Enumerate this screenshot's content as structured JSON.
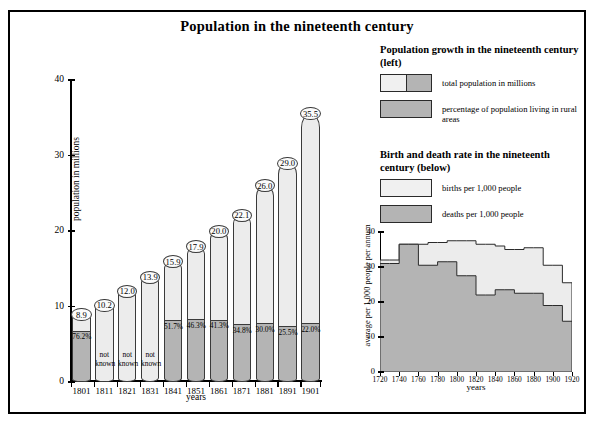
{
  "title": "Population in the nineteenth century",
  "legend1": {
    "heading": "Population growth in the nineteenth century (left)",
    "items": [
      {
        "label": "total population in millions",
        "swatch": "split-light-grey"
      },
      {
        "label": "percentage of population living in rural areas",
        "swatch": "grey"
      }
    ]
  },
  "legend2": {
    "heading": "Birth and death rate in the nineteenth century (below)",
    "items": [
      {
        "label": "births per 1,000 people",
        "swatch": "light"
      },
      {
        "label": "deaths per 1,000 people",
        "swatch": "grey"
      }
    ]
  },
  "chart_data": [
    {
      "type": "bar",
      "title": "Population growth in the nineteenth century",
      "xlabel": "years",
      "ylabel": "population in millions",
      "ylim": [
        0,
        40
      ],
      "yticks": [
        0,
        10,
        20,
        30,
        40
      ],
      "grid": false,
      "categories": [
        "1801",
        "1811",
        "1821",
        "1831",
        "1841",
        "1851",
        "1861",
        "1871",
        "1881",
        "1891",
        "1901"
      ],
      "series": [
        {
          "name": "total population in millions",
          "values": [
            8.9,
            10.2,
            12.0,
            13.9,
            15.9,
            17.9,
            20.0,
            22.1,
            26.0,
            29.0,
            35.5
          ],
          "labels": [
            "8.9",
            "10.2",
            "12.0",
            "13.9",
            "15.9",
            "17.9",
            "20.0",
            "22.1",
            "26.0",
            "29.0",
            "35.5"
          ]
        },
        {
          "name": "percentage of population living in rural areas",
          "values": [
            76.2,
            null,
            null,
            null,
            51.7,
            46.3,
            41.3,
            34.8,
            30.0,
            25.5,
            22.0
          ],
          "labels": [
            "76.2%",
            "not known",
            "not known",
            "not known",
            "51.7%",
            "46.3%",
            "41.3%",
            "34.8%",
            "30.0%",
            "25.5%",
            "22.0%"
          ]
        }
      ]
    },
    {
      "type": "area",
      "title": "Birth and death rate in the nineteenth century",
      "xlabel": "years",
      "ylabel": "average per 1,000 people per annum",
      "ylim": [
        0,
        40
      ],
      "yticks": [
        0,
        10,
        20,
        30,
        40
      ],
      "xlim": [
        1720,
        1920
      ],
      "xticks": [
        1720,
        1740,
        1760,
        1780,
        1800,
        1820,
        1840,
        1860,
        1880,
        1900,
        1920
      ],
      "grid": false,
      "x": [
        1720,
        1730,
        1740,
        1750,
        1760,
        1770,
        1780,
        1790,
        1800,
        1810,
        1820,
        1830,
        1840,
        1850,
        1860,
        1870,
        1880,
        1890,
        1900,
        1910,
        1920
      ],
      "series": [
        {
          "name": "births per 1,000 people",
          "values": [
            32.0,
            32.0,
            36.5,
            36.5,
            36.5,
            37.0,
            37.0,
            37.5,
            37.5,
            37.5,
            36.5,
            36.5,
            36.0,
            35.0,
            35.0,
            35.5,
            35.5,
            30.5,
            30.5,
            25.5,
            25.5
          ]
        },
        {
          "name": "deaths per 1,000 people",
          "values": [
            31.0,
            31.0,
            36.5,
            36.5,
            30.5,
            30.5,
            31.5,
            31.5,
            27.5,
            27.5,
            22.0,
            22.0,
            23.5,
            23.5,
            22.5,
            22.5,
            22.5,
            19.0,
            19.0,
            14.5,
            14.5
          ]
        }
      ]
    }
  ]
}
